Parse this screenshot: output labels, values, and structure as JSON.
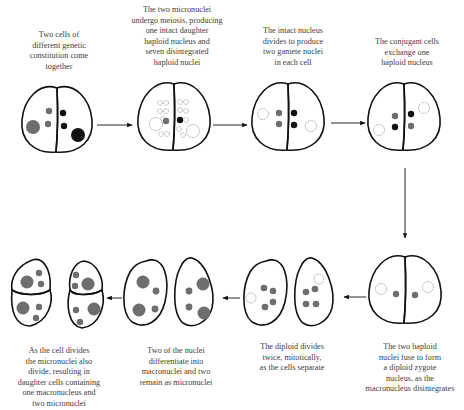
{
  "colors": {
    "outline": "#111111",
    "nucleus_grey": "#6e6e6e",
    "nucleus_black": "#111111",
    "disintegrated": "#9a9a9a"
  },
  "stages": [
    {
      "id": 1,
      "caption": [
        "Two cells of",
        "different genetic",
        "constitution come",
        "together"
      ]
    },
    {
      "id": 2,
      "caption": [
        "The two micronuclei",
        "undergo meiosis, producing",
        "one intact daughter",
        "haploid nucleus and",
        "seven disintegrated",
        "haploid nuclei"
      ]
    },
    {
      "id": 3,
      "caption": [
        "The intact nucleus",
        "divides to produce",
        "two gamete nuclei",
        "in each cell"
      ]
    },
    {
      "id": 4,
      "caption": [
        "The conjugant cells",
        "exchange one",
        "haploid nucleus"
      ]
    },
    {
      "id": 5,
      "caption": [
        "The two haploid",
        "nuclei fuse to form",
        "a diploid zygote",
        "nucleus, as the",
        "macronucleus disintegrates"
      ]
    },
    {
      "id": 6,
      "caption": [
        "The diploid divides",
        "twice, mitotically,",
        "as the cells separate"
      ]
    },
    {
      "id": 7,
      "caption": [
        "Two of the nuclei",
        "differentiate into",
        "macronuclei and two",
        "remain as micronuclei"
      ]
    },
    {
      "id": 8,
      "caption": [
        "As the cell divides",
        "the micronuclei also",
        "divide, resulting in",
        "daughter cells containing",
        "one macronucleus and",
        "two micronuclei"
      ]
    }
  ]
}
